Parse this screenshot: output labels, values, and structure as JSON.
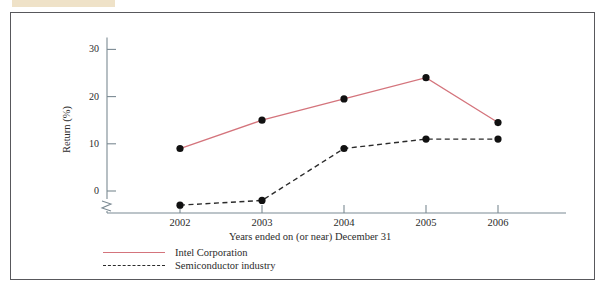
{
  "page": {
    "highlight_bar": "",
    "cut_text_left": "",
    "cut_text_right": ""
  },
  "colors": {
    "intel_line": "#d4747c",
    "industry_line": "#2b2b2b",
    "marker": "#111111",
    "axis": "#7b8a93",
    "frame": "#58585c",
    "highlight": "#efe2c8",
    "text": "#2b2b2b"
  },
  "chart_data": {
    "type": "line",
    "title": "",
    "xlabel": "Years ended on (or near) December 31",
    "ylabel": "Return (%)",
    "categories": [
      "2002",
      "2003",
      "2004",
      "2005",
      "2006"
    ],
    "ylim": [
      -4,
      32
    ],
    "yticks": [
      0,
      10,
      20,
      30
    ],
    "ytick_labels": [
      "0",
      "10",
      "20",
      "30"
    ],
    "grid": false,
    "axis_break": true,
    "legend_position": "below-left",
    "series": [
      {
        "name": "Intel Corporation",
        "style": "solid",
        "color": "#d4747c",
        "values": [
          9,
          15,
          19.5,
          24,
          14.5
        ]
      },
      {
        "name": "Semiconductor industry",
        "style": "dashed",
        "color": "#2b2b2b",
        "values": [
          -3,
          -2,
          9,
          11,
          11
        ]
      }
    ]
  },
  "legend": {
    "items": [
      {
        "label": "Intel Corporation"
      },
      {
        "label": "Semiconductor industry"
      }
    ]
  }
}
